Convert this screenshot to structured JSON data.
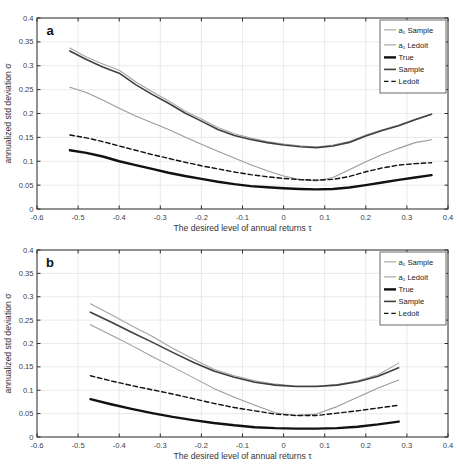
{
  "figure": {
    "width": 457,
    "height": 475,
    "background": "#ffffff"
  },
  "style": {
    "axis_color": "#2e2e2e",
    "grid_color": "#e4e4e4",
    "tick_label_color": "#404040",
    "legend_border_color": "#5a5a5a",
    "legend_background": "#ffffff"
  },
  "chart_data": [
    {
      "type": "line",
      "panel_label": "a",
      "xlabel": "The desired level of annual returns τ",
      "ylabel": "annualized std deviation σ",
      "xlim": [
        -0.6,
        0.4
      ],
      "ylim": [
        0,
        0.4
      ],
      "xticks": [
        -0.6,
        -0.5,
        -0.4,
        -0.3,
        -0.2,
        -0.1,
        0,
        0.1,
        0.2,
        0.3,
        0.4
      ],
      "xtick_labels": [
        "-0.6",
        "-0.5",
        "-0.4",
        "-0.3",
        "-0.2",
        "-0.1",
        "0",
        "0.1",
        "0.2",
        "0.3",
        "0.4"
      ],
      "yticks": [
        0,
        0.05,
        0.1,
        0.15,
        0.2,
        0.25,
        0.3,
        0.35,
        0.4
      ],
      "ytick_labels": [
        "0",
        "0.05",
        "0.1",
        "0.15",
        "0.2",
        "0.25",
        "0.3",
        "0.35",
        "0.4"
      ],
      "grid": true,
      "legend_position": "top-right",
      "series": [
        {
          "name": "a1-sample",
          "legend_label": "a₁ Sample",
          "color": "#a4a4a4",
          "width": 1.1,
          "dash": null,
          "x": [
            -0.52,
            -0.48,
            -0.44,
            -0.4,
            -0.36,
            -0.32,
            -0.28,
            -0.24,
            -0.2,
            -0.16,
            -0.12,
            -0.08,
            -0.04,
            0,
            0.04,
            0.08,
            0.12,
            0.16,
            0.2,
            0.24,
            0.28,
            0.32,
            0.36
          ],
          "y": [
            0.337,
            0.3185,
            0.3035,
            0.2905,
            0.2665,
            0.2455,
            0.2265,
            0.2055,
            0.1885,
            0.1705,
            0.1575,
            0.1485,
            0.1415,
            0.136,
            0.1325,
            0.13,
            0.134,
            0.1415,
            0.155,
            0.166,
            0.176,
            0.188,
            0.199
          ]
        },
        {
          "name": "a1-ledoit",
          "legend_label": "a₁ Ledoit",
          "color": "#9b9b9b",
          "width": 1.1,
          "dash": null,
          "x": [
            -0.52,
            -0.48,
            -0.44,
            -0.4,
            -0.36,
            -0.32,
            -0.28,
            -0.24,
            -0.2,
            -0.16,
            -0.12,
            -0.08,
            -0.04,
            0,
            0.04,
            0.08,
            0.12,
            0.16,
            0.2,
            0.24,
            0.28,
            0.32,
            0.36
          ],
          "y": [
            0.255,
            0.244,
            0.2285,
            0.211,
            0.195,
            0.1805,
            0.1665,
            0.151,
            0.1355,
            0.121,
            0.107,
            0.0925,
            0.08,
            0.069,
            0.0615,
            0.059,
            0.066,
            0.082,
            0.099,
            0.114,
            0.127,
            0.139,
            0.145
          ]
        },
        {
          "name": "true",
          "legend_label": "True",
          "color": "#111111",
          "width": 2.4,
          "dash": null,
          "x": [
            -0.52,
            -0.48,
            -0.44,
            -0.4,
            -0.36,
            -0.32,
            -0.28,
            -0.24,
            -0.2,
            -0.16,
            -0.12,
            -0.08,
            -0.04,
            0,
            0.04,
            0.08,
            0.12,
            0.16,
            0.2,
            0.24,
            0.28,
            0.32,
            0.36
          ],
          "y": [
            0.123,
            0.1175,
            0.11,
            0.1,
            0.092,
            0.084,
            0.076,
            0.069,
            0.063,
            0.057,
            0.052,
            0.048,
            0.0455,
            0.0435,
            0.042,
            0.0412,
            0.042,
            0.045,
            0.05,
            0.0555,
            0.061,
            0.066,
            0.071
          ]
        },
        {
          "name": "sample",
          "legend_label": "Sample",
          "color": "#3f3f3f",
          "width": 1.6,
          "dash": null,
          "x": [
            -0.52,
            -0.48,
            -0.44,
            -0.4,
            -0.36,
            -0.32,
            -0.28,
            -0.24,
            -0.2,
            -0.16,
            -0.12,
            -0.08,
            -0.04,
            0,
            0.04,
            0.08,
            0.12,
            0.16,
            0.2,
            0.24,
            0.28,
            0.32,
            0.36
          ],
          "y": [
            0.331,
            0.313,
            0.2975,
            0.2845,
            0.2605,
            0.24,
            0.2215,
            0.201,
            0.184,
            0.1665,
            0.154,
            0.1455,
            0.139,
            0.134,
            0.1305,
            0.1285,
            0.132,
            0.1395,
            0.153,
            0.1645,
            0.1745,
            0.187,
            0.1985
          ]
        },
        {
          "name": "ledoit",
          "legend_label": "Ledoit",
          "color": "#111111",
          "width": 1.4,
          "dash": "4.5,2.8",
          "x": [
            -0.52,
            -0.48,
            -0.44,
            -0.4,
            -0.36,
            -0.32,
            -0.28,
            -0.24,
            -0.2,
            -0.16,
            -0.12,
            -0.08,
            -0.04,
            0,
            0.04,
            0.08,
            0.12,
            0.16,
            0.2,
            0.24,
            0.28,
            0.32,
            0.36
          ],
          "y": [
            0.155,
            0.149,
            0.141,
            0.132,
            0.123,
            0.114,
            0.106,
            0.098,
            0.0905,
            0.084,
            0.0775,
            0.072,
            0.0675,
            0.064,
            0.0615,
            0.0605,
            0.062,
            0.068,
            0.078,
            0.086,
            0.092,
            0.095,
            0.097
          ]
        }
      ]
    },
    {
      "type": "line",
      "panel_label": "b",
      "xlabel": "The desired level of annual returns τ",
      "ylabel": "annualized std deviation σ",
      "xlim": [
        -0.6,
        0.4
      ],
      "ylim": [
        0,
        0.4
      ],
      "xticks": [
        -0.6,
        -0.5,
        -0.4,
        -0.3,
        -0.2,
        -0.1,
        0,
        0.1,
        0.2,
        0.3,
        0.4
      ],
      "xtick_labels": [
        "-0.6",
        "-0.5",
        "-0.4",
        "-0.3",
        "-0.2",
        "-0.1",
        "0",
        "0.1",
        "0.2",
        "0.3",
        "0.4"
      ],
      "yticks": [
        0,
        0.05,
        0.1,
        0.15,
        0.2,
        0.25,
        0.3,
        0.35,
        0.4
      ],
      "ytick_labels": [
        "0",
        "0.05",
        "0.1",
        "0.15",
        "0.2",
        "0.25",
        "0.3",
        "0.35",
        "0.4"
      ],
      "grid": true,
      "legend_position": "top-right",
      "series": [
        {
          "name": "a1-sample",
          "legend_label": "a₁ Sample",
          "color": "#a4a4a4",
          "width": 1.1,
          "dash": null,
          "x": [
            -0.47,
            -0.42,
            -0.37,
            -0.32,
            -0.27,
            -0.22,
            -0.17,
            -0.12,
            -0.07,
            -0.02,
            0.03,
            0.08,
            0.13,
            0.18,
            0.23,
            0.28
          ],
          "y": [
            0.285,
            0.262,
            0.238,
            0.2155,
            0.19,
            0.167,
            0.145,
            0.131,
            0.12,
            0.113,
            0.109,
            0.109,
            0.112,
            0.12,
            0.133,
            0.158
          ]
        },
        {
          "name": "a1-ledoit",
          "legend_label": "a₁ Ledoit",
          "color": "#9b9b9b",
          "width": 1.1,
          "dash": null,
          "x": [
            -0.47,
            -0.42,
            -0.37,
            -0.32,
            -0.27,
            -0.22,
            -0.17,
            -0.12,
            -0.07,
            -0.02,
            0.03,
            0.08,
            0.13,
            0.18,
            0.23,
            0.28
          ],
          "y": [
            0.24,
            0.218,
            0.196,
            0.172,
            0.15,
            0.127,
            0.104,
            0.085,
            0.068,
            0.052,
            0.046,
            0.049,
            0.065,
            0.085,
            0.105,
            0.122
          ]
        },
        {
          "name": "true",
          "legend_label": "True",
          "color": "#111111",
          "width": 2.4,
          "dash": null,
          "x": [
            -0.47,
            -0.42,
            -0.37,
            -0.32,
            -0.27,
            -0.22,
            -0.17,
            -0.12,
            -0.07,
            -0.02,
            0.03,
            0.08,
            0.13,
            0.18,
            0.23,
            0.28
          ],
          "y": [
            0.081,
            0.07,
            0.06,
            0.051,
            0.043,
            0.036,
            0.03,
            0.025,
            0.021,
            0.019,
            0.018,
            0.018,
            0.019,
            0.022,
            0.027,
            0.033
          ]
        },
        {
          "name": "sample",
          "legend_label": "Sample",
          "color": "#3f3f3f",
          "width": 1.6,
          "dash": null,
          "x": [
            -0.47,
            -0.42,
            -0.37,
            -0.32,
            -0.27,
            -0.22,
            -0.17,
            -0.12,
            -0.07,
            -0.02,
            0.03,
            0.08,
            0.13,
            0.18,
            0.23,
            0.28
          ],
          "y": [
            0.267,
            0.246,
            0.224,
            0.203,
            0.181,
            0.16,
            0.141,
            0.128,
            0.117,
            0.111,
            0.108,
            0.108,
            0.111,
            0.118,
            0.13,
            0.148
          ]
        },
        {
          "name": "ledoit",
          "legend_label": "Ledoit",
          "color": "#111111",
          "width": 1.4,
          "dash": "4.5,2.8",
          "x": [
            -0.47,
            -0.42,
            -0.37,
            -0.32,
            -0.27,
            -0.22,
            -0.17,
            -0.12,
            -0.07,
            -0.02,
            0.03,
            0.08,
            0.13,
            0.18,
            0.23,
            0.28
          ],
          "y": [
            0.131,
            0.12,
            0.11,
            0.101,
            0.092,
            0.082,
            0.072,
            0.063,
            0.056,
            0.049,
            0.046,
            0.046,
            0.051,
            0.056,
            0.062,
            0.068
          ]
        }
      ]
    }
  ]
}
